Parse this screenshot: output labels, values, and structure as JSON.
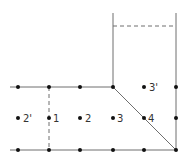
{
  "diagram": {
    "type": "grid-stencil",
    "labels": [
      {
        "id": "2p",
        "text": "2'"
      },
      {
        "id": "1",
        "text": "1"
      },
      {
        "id": "2",
        "text": "2"
      },
      {
        "id": "3",
        "text": "3"
      },
      {
        "id": "4",
        "text": "4"
      },
      {
        "id": "3p",
        "text": "3'"
      }
    ],
    "colors": {
      "line": "#6e6e6e",
      "node": "#111111",
      "label": "#333333"
    }
  }
}
